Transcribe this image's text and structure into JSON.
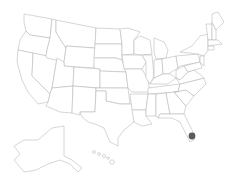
{
  "map": {
    "title": "United States",
    "background": "#ffffff",
    "stroke_color": "#b4b4b4",
    "fill_color": "#ffffff",
    "marker": {
      "label": "Miami, FL",
      "color": "#5a5a5a",
      "x": 192,
      "y": 136,
      "r": 3.4
    }
  }
}
